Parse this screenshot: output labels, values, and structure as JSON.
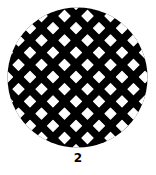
{
  "figure": {
    "label": "2",
    "shape": "circle",
    "fill_color": "#000000",
    "hole_color": "#ffffff",
    "background": "#ffffff",
    "circle": {
      "cx": 77.5,
      "cy": 77.5,
      "r": 70
    },
    "hole_grid": {
      "pattern": "diamond-lattice",
      "center_hole": {
        "x": 76,
        "y": 77
      },
      "column_spacing": 23,
      "row_spacing": 12.2,
      "row_offset": 11.5,
      "hole_diagonal": 11
    }
  }
}
